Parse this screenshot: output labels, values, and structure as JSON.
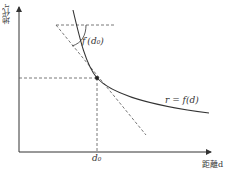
{
  "diagram": {
    "type": "economics-graph",
    "y_axis_label": "地代r",
    "x_axis_label": "距離d",
    "curve_label": "r = f(d)",
    "slope_label": "f′(d₀)",
    "x_tick_label": "d₀",
    "elements": [
      {
        "kind": "curve",
        "name": "rent-curve",
        "description": "Downward-sloping convex curve r = f(d)"
      },
      {
        "kind": "point",
        "name": "tangent-point",
        "at": "d₀"
      },
      {
        "kind": "dashed-line",
        "name": "tangent-line",
        "description": "Tangent to curve at d₀"
      },
      {
        "kind": "dashed-line",
        "name": "horizontal-reference",
        "description": "Horizontal dashed reference line at top"
      },
      {
        "kind": "dashed-line",
        "name": "projection-lines",
        "description": "Dashed lines from point to axes"
      },
      {
        "kind": "arc",
        "name": "angle-arc",
        "description": "Angle arc marking slope f′(d₀)"
      }
    ]
  },
  "colors": {
    "line": "#333333",
    "dash": "#555555",
    "background": "#ffffff"
  }
}
